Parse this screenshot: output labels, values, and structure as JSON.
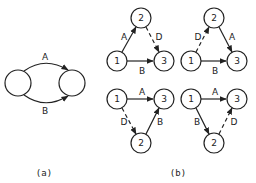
{
  "panel_a": {
    "caption": "(a)",
    "edge_top_label": "A",
    "edge_bottom_label": "B"
  },
  "panel_b": {
    "caption": "(b)",
    "diagrams": [
      {
        "nodes": {
          "n1": "1",
          "n2": "2",
          "n3": "3"
        },
        "edges": {
          "e12": "A",
          "e23": "D",
          "e13": "B"
        }
      },
      {
        "nodes": {
          "n1": "1",
          "n2": "2",
          "n3": "3"
        },
        "edges": {
          "e12": "D",
          "e23": "A",
          "e13": "B"
        }
      },
      {
        "nodes": {
          "n1": "1",
          "n2": "2",
          "n3": "3"
        },
        "edges": {
          "e13": "A",
          "e12": "D",
          "e23": "B"
        }
      },
      {
        "nodes": {
          "n1": "1",
          "n2": "2",
          "n3": "3"
        },
        "edges": {
          "e13": "A",
          "e12": "B",
          "e23": "D"
        }
      }
    ]
  },
  "colors": {
    "stroke": "#222222",
    "background": "#ffffff"
  }
}
